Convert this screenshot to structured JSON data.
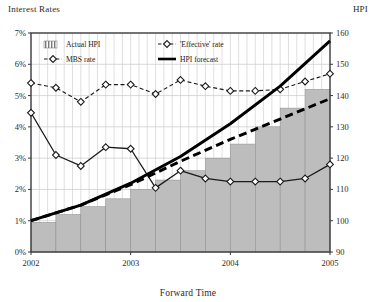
{
  "chart_data": {
    "type": "line",
    "title": "",
    "xlabel": "Forward Time",
    "ylabel": "Interest Rates",
    "y2label": "HPI",
    "grid": true,
    "legend_position": "top-left-inside",
    "xlim": [
      2002.0,
      2005.0
    ],
    "x_tick_labels": [
      "2002",
      "2003",
      "2004",
      "2005"
    ],
    "x_tick_values": [
      2002,
      2003,
      2004,
      2005
    ],
    "ylim": [
      0,
      7
    ],
    "y_tick_labels": [
      "0%",
      "1%",
      "2%",
      "3%",
      "4%",
      "5%",
      "6%",
      "7%"
    ],
    "y_tick_values": [
      0,
      1,
      2,
      3,
      4,
      5,
      6,
      7
    ],
    "y2lim": [
      90,
      160
    ],
    "y2_tick_labels": [
      "90",
      "100",
      "110",
      "120",
      "130",
      "140",
      "150",
      "160"
    ],
    "y2_tick_values": [
      90,
      100,
      110,
      120,
      130,
      140,
      150,
      160
    ],
    "series": [
      {
        "name": "Actual HPI",
        "type": "bar",
        "axis": "right",
        "color": "#bdbdbd",
        "edge_color": "#8c8c8c",
        "x": [
          2002.0,
          2002.25,
          2002.5,
          2002.75,
          2003.0,
          2003.25,
          2003.5,
          2003.75,
          2004.0,
          2004.25,
          2004.5,
          2004.75
        ],
        "values": [
          99.5,
          102,
          104.5,
          107,
          110,
          113,
          116,
          120,
          124.5,
          130,
          136,
          142
        ]
      },
      {
        "name": "'Effective' rate",
        "type": "line",
        "axis": "left",
        "marker": "diamond",
        "line_style": "dashed",
        "color": "#1a1a1a",
        "x": [
          2002.0,
          2002.25,
          2002.5,
          2002.75,
          2003.0,
          2003.25,
          2003.5,
          2003.75,
          2004.0,
          2004.25,
          2004.5,
          2004.75,
          2005.0
        ],
        "values": [
          5.4,
          5.25,
          4.8,
          5.35,
          5.35,
          5.05,
          5.5,
          5.3,
          5.15,
          5.15,
          5.2,
          5.45,
          5.7
        ]
      },
      {
        "name": "MBS rate",
        "type": "line",
        "axis": "left",
        "marker": "diamond",
        "line_style": "solid",
        "color": "#1a1a1a",
        "x": [
          2002.0,
          2002.25,
          2002.5,
          2002.75,
          2003.0,
          2003.25,
          2003.5,
          2003.75,
          2004.0,
          2004.25,
          2004.5,
          2004.75,
          2005.0
        ],
        "values": [
          4.45,
          3.1,
          2.75,
          3.35,
          3.3,
          2.05,
          2.6,
          2.35,
          2.25,
          2.25,
          2.25,
          2.35,
          2.8
        ]
      },
      {
        "name": "HPI forecast",
        "type": "line",
        "axis": "right",
        "marker": "none",
        "line_style": "solid-thick",
        "color": "#000000",
        "x": [
          2002.0,
          2002.5,
          2003.0,
          2003.5,
          2004.0,
          2004.5,
          2005.0
        ],
        "values": [
          100,
          105,
          112,
          120.5,
          131,
          143,
          157.5
        ]
      },
      {
        "name": "HPI forecast (lower)",
        "type": "line",
        "axis": "right",
        "marker": "none",
        "line_style": "dashed-thick",
        "color": "#000000",
        "x": [
          2002.0,
          2002.5,
          2003.0,
          2003.5,
          2004.0,
          2004.5,
          2005.0
        ],
        "values": [
          100,
          105,
          111.5,
          119,
          126,
          132.5,
          139
        ]
      }
    ],
    "legend": [
      {
        "label": "Actual HPI",
        "swatch": "hatched-bar"
      },
      {
        "label": "'Effective' rate",
        "swatch": "diamond-dashed-line"
      },
      {
        "label": "MBS rate",
        "swatch": "diamond-dashed-line"
      },
      {
        "label": "HPI forecast",
        "swatch": "solid-thick-line"
      }
    ]
  }
}
